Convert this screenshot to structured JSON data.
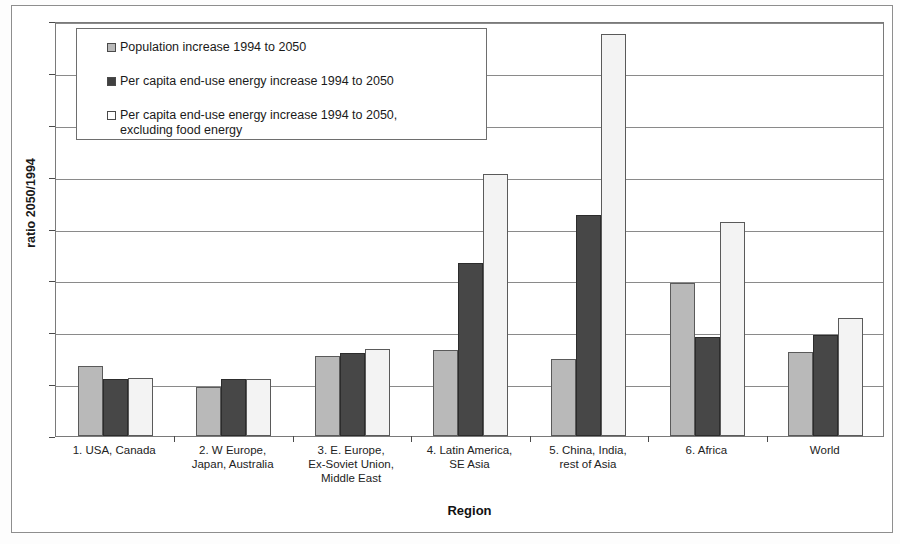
{
  "chart_data": {
    "type": "bar",
    "title": "",
    "xlabel": "Region",
    "ylabel": "ratio 2050/1994",
    "ylim": [
      0,
      8
    ],
    "ytick_labels": [
      "0",
      "1",
      "2",
      "3",
      "4",
      "5",
      "6",
      "7",
      "8"
    ],
    "grid": true,
    "legend_position": "top-left-inside",
    "categories": [
      "1. USA, Canada",
      "2. W Europe,\nJapan, Australia",
      "3. E. Europe,\nEx-Soviet Union,\nMiddle East",
      "4. Latin America,\nSE Asia",
      "5. China, India,\nrest of Asia",
      "6. Africa",
      "World"
    ],
    "series": [
      {
        "name": "Population increase 1994 to 2050",
        "color": "#b9b9b9",
        "values": [
          1.35,
          0.94,
          1.55,
          1.65,
          1.48,
          2.95,
          1.62
        ]
      },
      {
        "name": "Per capita end-use energy increase 1994 to 2050",
        "color": "#474747",
        "values": [
          1.1,
          1.09,
          1.6,
          3.33,
          4.27,
          1.9,
          1.95
        ]
      },
      {
        "name": "Per capita end-use energy increase 1994 to 2050,\nexcluding food energy",
        "color": "#f3f3f3",
        "values": [
          1.11,
          1.09,
          1.67,
          5.05,
          7.75,
          4.13,
          2.27
        ]
      }
    ]
  },
  "legend": {
    "entries": [
      "Population increase 1994 to 2050",
      "Per capita end-use energy increase 1994 to 2050",
      "Per capita end-use energy increase 1994 to 2050,\nexcluding food energy"
    ]
  },
  "axes": {
    "y_title": "ratio 2050/1994",
    "x_title": "Region"
  }
}
